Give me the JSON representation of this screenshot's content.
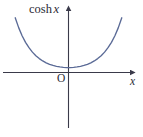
{
  "figure": {
    "name": "cosh-x-graph",
    "background_color": "#ffffff",
    "axis_color": "#3a3a4a",
    "curve_color": "#5a6a96",
    "text_color": "#2b2b35"
  },
  "labels": {
    "curve_label_prefix": "cosh",
    "curve_label_variable": "x",
    "origin": "O",
    "x_axis": "x"
  },
  "chart_data": {
    "type": "line",
    "xlabel": "x",
    "ylabel": "cosh x",
    "grid": false,
    "legend": null,
    "xlim": [
      -3.2,
      3.2
    ],
    "ylim": [
      0,
      12.5
    ],
    "series": [
      {
        "name": "cosh x",
        "color": "#5a6a96",
        "x": [
          -3.1,
          -2.9,
          -2.7,
          -2.5,
          -2.3,
          -2.1,
          -1.9,
          -1.7,
          -1.5,
          -1.3,
          -1.1,
          -0.9,
          -0.7,
          -0.5,
          -0.3,
          -0.1,
          0.0,
          0.1,
          0.3,
          0.5,
          0.7,
          0.9,
          1.1,
          1.3,
          1.5,
          1.7,
          1.9,
          2.1,
          2.3,
          2.5,
          2.7,
          2.9,
          3.1
        ],
        "y": [
          11.12,
          9.12,
          7.47,
          6.13,
          5.04,
          4.14,
          3.42,
          2.83,
          2.35,
          1.97,
          1.67,
          1.43,
          1.26,
          1.13,
          1.05,
          1.0,
          1.0,
          1.0,
          1.05,
          1.13,
          1.26,
          1.43,
          1.67,
          1.97,
          2.35,
          2.83,
          3.42,
          4.14,
          5.04,
          6.13,
          7.47,
          9.12,
          11.12
        ]
      }
    ],
    "annotations": [
      {
        "text": "cosh x",
        "role": "y-axis-label"
      },
      {
        "text": "O",
        "role": "origin-marker"
      },
      {
        "text": "x",
        "role": "x-axis-label"
      }
    ],
    "axes": {
      "x_axis_arrow": true,
      "y_axis_arrow": true,
      "ticks": []
    }
  }
}
